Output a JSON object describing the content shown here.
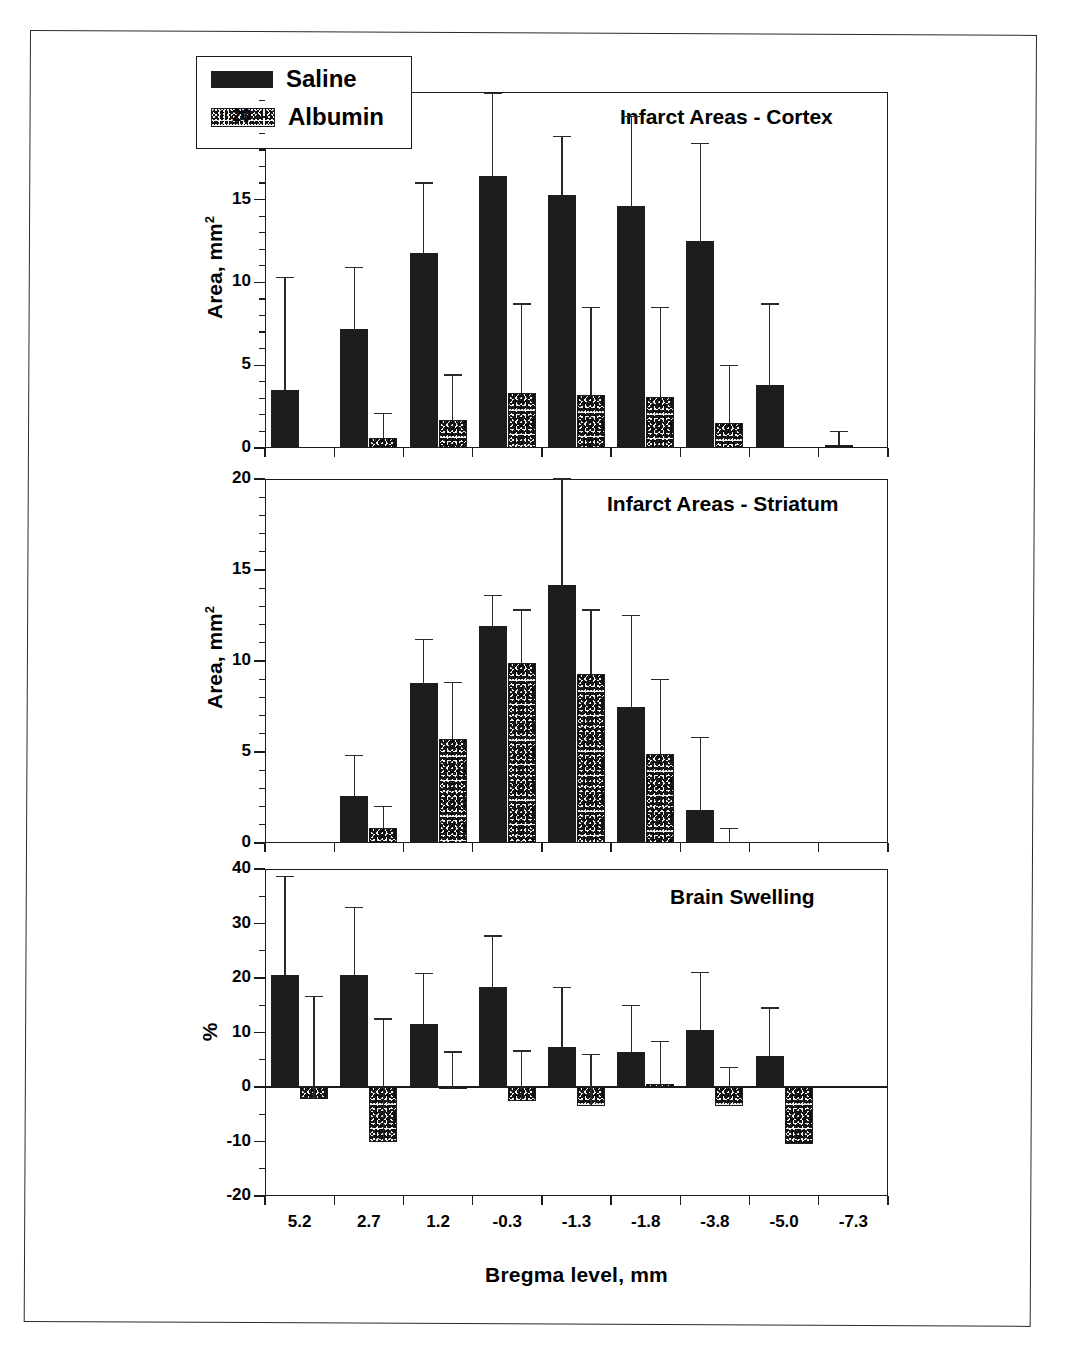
{
  "figure": {
    "xaxis_title": "Bregma level, mm",
    "categories": [
      "5.2",
      "2.7",
      "1.2",
      "-0.3",
      "-1.3",
      "-1.8",
      "-3.8",
      "-5.0",
      "-7.3"
    ],
    "legend": {
      "items": [
        {
          "label": "Saline",
          "swatch": "solid-black"
        },
        {
          "label": "Albumin",
          "swatch": "stippled"
        }
      ]
    }
  },
  "panels": [
    {
      "id": "cortex",
      "title": "Infarct Areas - Cortex",
      "ylabel": "Area, mm",
      "ylabel_sup": "2",
      "yticks": [
        "0",
        "5",
        "10",
        "15",
        "20"
      ]
    },
    {
      "id": "striatum",
      "title": "Infarct Areas - Striatum",
      "ylabel": "Area, mm",
      "ylabel_sup": "2",
      "yticks": [
        "0",
        "5",
        "10",
        "15",
        "20"
      ]
    },
    {
      "id": "swelling",
      "title": "Brain Swelling",
      "ylabel": "%",
      "ylabel_sup": "",
      "yticks": [
        "-20",
        "-10",
        "0",
        "10",
        "20",
        "30",
        "40"
      ]
    }
  ],
  "chart_data": [
    {
      "type": "bar",
      "title": "Infarct Areas - Cortex",
      "xlabel": "Bregma level, mm",
      "ylabel": "Area, mm2",
      "ylim": [
        0,
        21.5
      ],
      "yticks": [
        0,
        5,
        10,
        15,
        20
      ],
      "grid": false,
      "legend_position": "top-left",
      "categories": [
        "5.2",
        "2.7",
        "1.2",
        "-0.3",
        "-1.3",
        "-1.8",
        "-3.8",
        "-5.0",
        "-7.3"
      ],
      "series": [
        {
          "name": "Saline",
          "values": [
            3.5,
            7.2,
            11.8,
            16.4,
            15.3,
            14.6,
            12.5,
            3.8,
            0.2
          ],
          "error_upper": [
            10.3,
            10.9,
            16.0,
            21.4,
            18.8,
            20.0,
            18.4,
            8.7,
            1.0
          ]
        },
        {
          "name": "Albumin",
          "values": [
            null,
            0.6,
            1.7,
            3.3,
            3.2,
            3.1,
            1.5,
            null,
            null
          ],
          "error_upper": [
            null,
            2.1,
            4.4,
            8.7,
            8.5,
            8.5,
            5.0,
            null,
            null
          ]
        }
      ]
    },
    {
      "type": "bar",
      "title": "Infarct Areas - Striatum",
      "xlabel": "Bregma level, mm",
      "ylabel": "Area, mm2",
      "ylim": [
        0,
        20
      ],
      "yticks": [
        0,
        5,
        10,
        15,
        20
      ],
      "grid": false,
      "categories": [
        "5.2",
        "2.7",
        "1.2",
        "-0.3",
        "-1.3",
        "-1.8",
        "-3.8",
        "-5.0",
        "-7.3"
      ],
      "series": [
        {
          "name": "Saline",
          "values": [
            null,
            2.6,
            8.8,
            11.9,
            14.2,
            7.5,
            1.8,
            null,
            null
          ],
          "error_upper": [
            null,
            4.8,
            11.2,
            13.6,
            20.0,
            12.5,
            5.8,
            null,
            null
          ]
        },
        {
          "name": "Albumin",
          "values": [
            null,
            0.8,
            5.7,
            9.9,
            9.3,
            4.9,
            null,
            null,
            null
          ],
          "error_upper": [
            null,
            2.0,
            8.8,
            12.8,
            12.8,
            9.0,
            0.8,
            null,
            null
          ]
        }
      ]
    },
    {
      "type": "bar",
      "title": "Brain Swelling",
      "xlabel": "Bregma level, mm",
      "ylabel": "%",
      "ylim": [
        -20,
        40
      ],
      "yticks": [
        -20,
        -10,
        0,
        10,
        20,
        30,
        40
      ],
      "grid": false,
      "categories": [
        "5.2",
        "2.7",
        "1.2",
        "-0.3",
        "-1.3",
        "-1.8",
        "-3.8",
        "-5.0",
        "-7.3"
      ],
      "series": [
        {
          "name": "Saline",
          "values": [
            20.6,
            20.6,
            11.6,
            18.4,
            7.4,
            6.5,
            10.5,
            5.6,
            null
          ],
          "error_upper": [
            38.6,
            33.0,
            20.8,
            27.7,
            18.3,
            15.0,
            21.0,
            14.5,
            null
          ]
        },
        {
          "name": "Albumin",
          "values": [
            -2.2,
            -10.0,
            -0.4,
            -2.5,
            -3.5,
            0.5,
            -3.5,
            -10.5,
            null
          ],
          "error_upper": [
            16.6,
            12.5,
            6.4,
            6.6,
            6.0,
            8.3,
            3.6,
            null,
            null
          ]
        }
      ]
    }
  ]
}
